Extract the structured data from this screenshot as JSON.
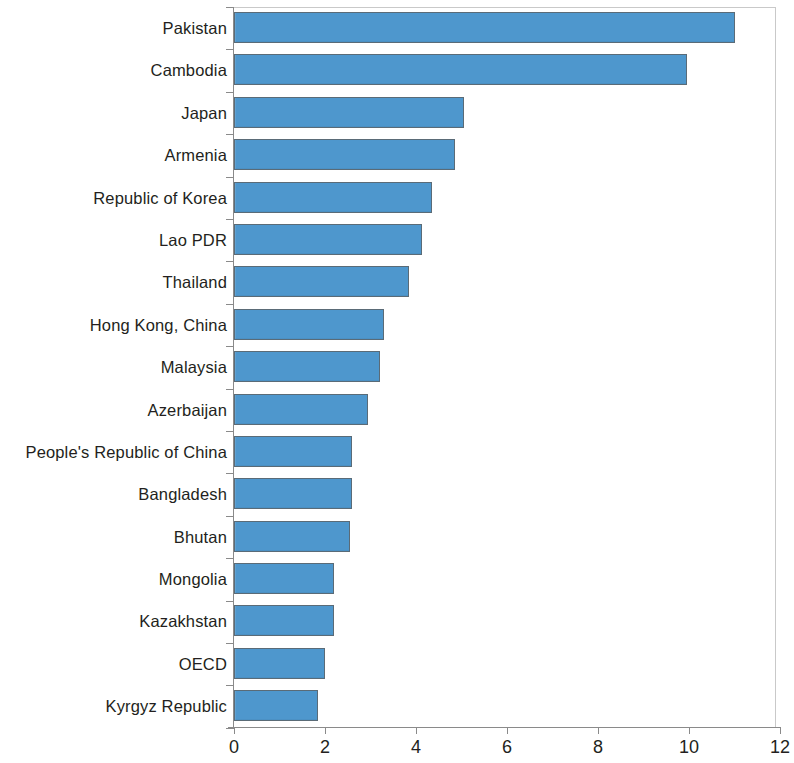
{
  "chart_data": {
    "type": "bar",
    "orientation": "horizontal",
    "title": "",
    "xlabel": "",
    "ylabel": "",
    "xlim": [
      0,
      12
    ],
    "xticks": [
      0,
      2,
      4,
      6,
      8,
      10,
      12
    ],
    "xtick_labels": [
      "0",
      "2",
      "4",
      "6",
      "8",
      "10",
      "12"
    ],
    "grid": false,
    "legend": null,
    "bar_color": "#4e97cd",
    "bar_edge_color": "#5a6b77",
    "axis_color": "#8a8a8a",
    "categories": [
      "Pakistan",
      "Cambodia",
      "Japan",
      "Armenia",
      "Republic of Korea",
      "Lao PDR",
      "Thailand",
      "Hong Kong, China",
      "Malaysia",
      "Azerbaijan",
      "People's Republic of China",
      "Bangladesh",
      "Bhutan",
      "Mongolia",
      "Kazakhstan",
      "OECD",
      "Kyrgyz Republic"
    ],
    "values": [
      11.0,
      9.95,
      5.05,
      4.85,
      4.35,
      4.13,
      3.85,
      3.3,
      3.2,
      2.95,
      2.6,
      2.6,
      2.55,
      2.2,
      2.2,
      2.0,
      1.85
    ]
  }
}
